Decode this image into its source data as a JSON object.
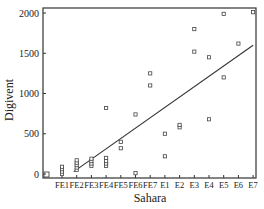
{
  "chart_data": {
    "type": "scatter",
    "title": "",
    "xlabel": "Sahara",
    "ylabel": "Digivent",
    "categories": [
      "FE1",
      "FE2",
      "FE3",
      "FE4",
      "FE5",
      "FE6",
      "FE7",
      "E1",
      "E2",
      "E3",
      "E4",
      "E5",
      "E6",
      "E7"
    ],
    "yticks": [
      0,
      500,
      1000,
      1500,
      2000
    ],
    "ylim": [
      -30,
      2070
    ],
    "grid": false,
    "legend": null,
    "series": [
      {
        "name": "observations",
        "marker": "open-square",
        "points": [
          {
            "x": "FE1",
            "y": 0
          },
          {
            "x": "FE1",
            "y": 30
          },
          {
            "x": "FE1",
            "y": 60
          },
          {
            "x": "FE1",
            "y": 90
          },
          {
            "x": "FE2",
            "y": 50
          },
          {
            "x": "FE2",
            "y": 80
          },
          {
            "x": "FE2",
            "y": 110
          },
          {
            "x": "FE2",
            "y": 140
          },
          {
            "x": "FE2",
            "y": 170
          },
          {
            "x": "FE3",
            "y": 100
          },
          {
            "x": "FE3",
            "y": 130
          },
          {
            "x": "FE3",
            "y": 160
          },
          {
            "x": "FE3",
            "y": 190
          },
          {
            "x": "FE4",
            "y": 100
          },
          {
            "x": "FE4",
            "y": 130
          },
          {
            "x": "FE4",
            "y": 160
          },
          {
            "x": "FE4",
            "y": 200
          },
          {
            "x": "FE4",
            "y": 820
          },
          {
            "x": "FE5",
            "y": 320
          },
          {
            "x": "FE5",
            "y": 400
          },
          {
            "x": "FE6",
            "y": 10
          },
          {
            "x": "FE6",
            "y": 740
          },
          {
            "x": "FE7",
            "y": 1100
          },
          {
            "x": "FE7",
            "y": 1250
          },
          {
            "x": "E1",
            "y": 220
          },
          {
            "x": "E1",
            "y": 500
          },
          {
            "x": "E2",
            "y": 580
          },
          {
            "x": "E2",
            "y": 610
          },
          {
            "x": "E3",
            "y": 1520
          },
          {
            "x": "E3",
            "y": 1800
          },
          {
            "x": "E4",
            "y": 680
          },
          {
            "x": "E4",
            "y": 1450
          },
          {
            "x": "E5",
            "y": 1200
          },
          {
            "x": "E5",
            "y": 1990
          },
          {
            "x": "E6",
            "y": 1620
          },
          {
            "x": "E7",
            "y": 2010
          }
        ]
      }
    ],
    "origin_marker": {
      "x_index": -1.1,
      "y": 0
    },
    "fit_line": {
      "type": "linear",
      "x_start_index": 0.8,
      "y_start": 30,
      "x_end_index": 13,
      "y_end": 1600
    }
  },
  "layout": {
    "plot": {
      "left": 43,
      "top": 8,
      "right": 256,
      "bottom": 178
    },
    "y_px_at_0": 174,
    "y_px_at_2000": 13,
    "x_first_tick_px": 62,
    "x_tick_step_px": 14.7,
    "colors": {
      "axis": "#333333",
      "marker": "#444444",
      "line": "#333333",
      "text": "#222222"
    }
  }
}
